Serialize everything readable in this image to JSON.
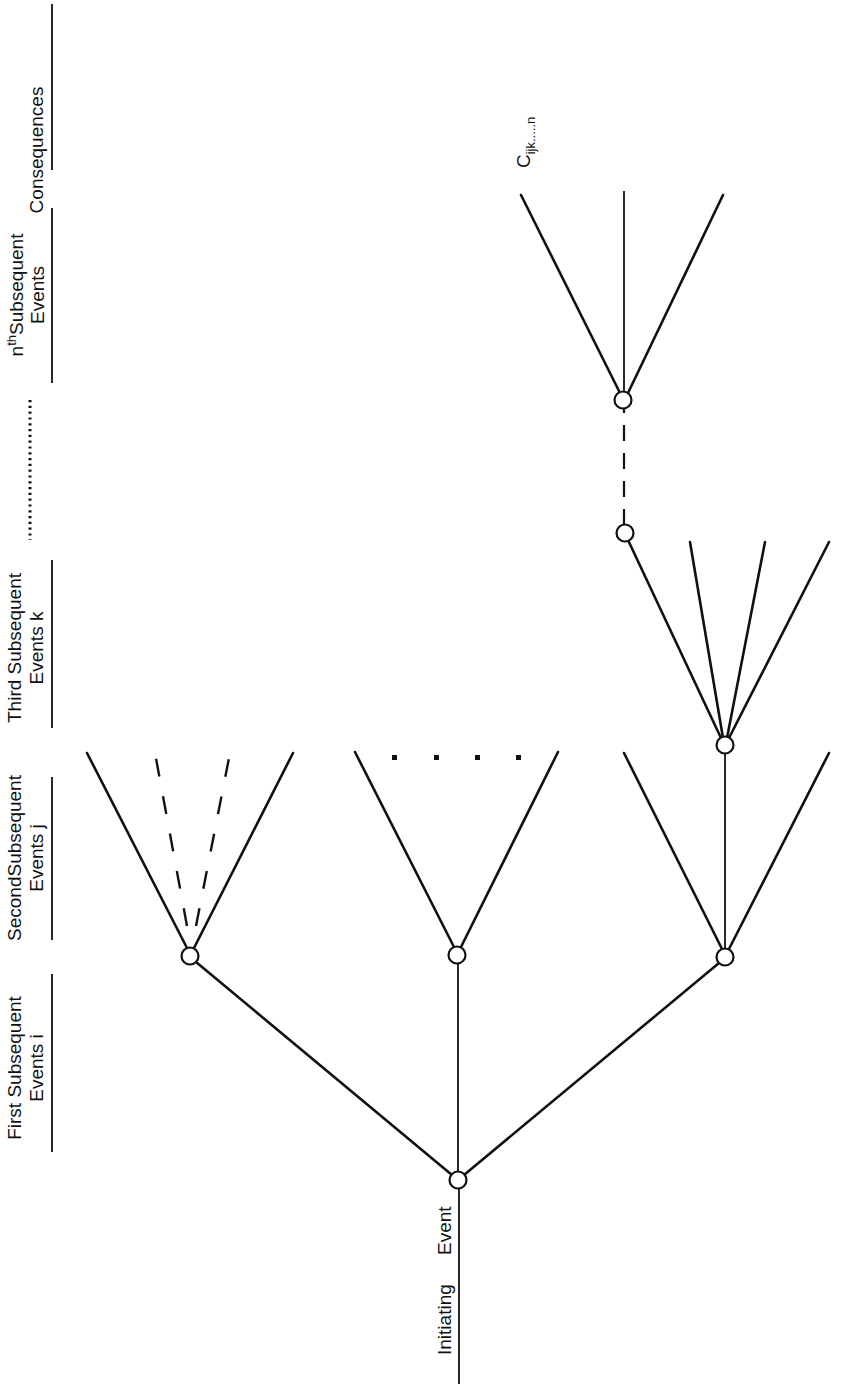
{
  "diagram": {
    "type": "event-tree",
    "orientation": "rotated-90-ccw",
    "stages": [
      {
        "id": "initiating",
        "line1": "Initiating",
        "line2": "Event"
      },
      {
        "id": "first",
        "line1": "First  Subsequent",
        "line2": "Events i"
      },
      {
        "id": "second",
        "line1": "SecondSubsequent",
        "line2": "Events j"
      },
      {
        "id": "third",
        "line1": "Third Subsequent",
        "line2": "Events k"
      },
      {
        "id": "ellipsis",
        "line1": "....................",
        "line2": ""
      },
      {
        "id": "nth",
        "line1_sup_base": "n",
        "line1_sup": "th",
        "line1_rest": "Subsequent",
        "line2": "Events"
      },
      {
        "id": "consequences",
        "line1": "Consequences",
        "line2": ""
      }
    ],
    "consequence_label": {
      "base": "C",
      "subscript": "ijk.....n"
    },
    "nodes": [
      {
        "id": "initiating-node",
        "x": 458,
        "y": 1180
      },
      {
        "id": "first-left",
        "x": 190,
        "y": 956
      },
      {
        "id": "first-center",
        "x": 457,
        "y": 955
      },
      {
        "id": "first-right",
        "x": 725,
        "y": 957
      },
      {
        "id": "second-right-center",
        "x": 725,
        "y": 745
      },
      {
        "id": "third-node",
        "x": 625,
        "y": 533
      },
      {
        "id": "nth-node",
        "x": 623,
        "y": 400
      }
    ],
    "colors": {
      "ink": "#111111",
      "background": "#ffffff"
    }
  }
}
